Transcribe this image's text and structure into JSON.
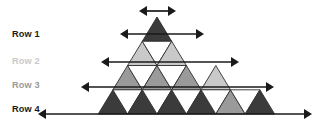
{
  "figure": {
    "background_color": "#ffffff",
    "width": 331,
    "height": 126
  },
  "palette": {
    "dark_gray": "#3b3b3b",
    "medium_gray": "#9a9a9a",
    "light_gray": "#c9c9c9",
    "white": "#ffffff",
    "edge_stroke": "#2f2f2f",
    "arrow_color": "#1a1a1a",
    "label_dark": "#1a1a1a",
    "label_light": "#c9c9c9",
    "label_medium": "#9a9a9a"
  },
  "labels": {
    "items": [
      {
        "text": "Row 1",
        "color": "#1a1a1a",
        "x": 12,
        "y": 35
      },
      {
        "text": "Row 2",
        "color": "#c9c9c9",
        "x": 12,
        "y": 62
      },
      {
        "text": "Row 3",
        "color": "#9a9a9a",
        "x": 12,
        "y": 86
      },
      {
        "text": "Row 4",
        "color": "#1a1a1a",
        "x": 12,
        "y": 110
      }
    ]
  },
  "arrows": {
    "items": [
      {
        "name": "arrow-row-0",
        "y": 11,
        "x1": 139,
        "x2": 176,
        "label": "row 0 span"
      },
      {
        "name": "arrow-row-1",
        "y": 34,
        "x1": 120,
        "x2": 204,
        "label": "row 1 span"
      },
      {
        "name": "arrow-row-2",
        "y": 62,
        "x1": 101,
        "x2": 239,
        "label": "row 2 span"
      },
      {
        "name": "arrow-row-3",
        "y": 87,
        "x1": 81,
        "x2": 274,
        "label": "row 3 span"
      },
      {
        "name": "arrow-row-4",
        "y": 114,
        "x1": 38,
        "x2": 312,
        "label": "row 4 span"
      }
    ],
    "head_length": 8,
    "head_half_width": 5
  },
  "chart_data": {
    "type": "diagram",
    "rows": [
      {
        "row": 1,
        "label": "Row 1",
        "up_triangles": 1,
        "down_triangles": 0,
        "fill": "#3b3b3b"
      },
      {
        "row": 2,
        "label": "Row 2",
        "up_triangles": 2,
        "down_triangles": 1,
        "fill": "#c9c9c9"
      },
      {
        "row": 3,
        "label": "Row 3",
        "up_triangles": 3,
        "down_triangles": 2,
        "fill": "#9a9a9a"
      },
      {
        "row": 4,
        "label": "Row 4",
        "up_triangles": 4,
        "down_triangles": 3,
        "fill": "#3b3b3b"
      }
    ],
    "geometry": {
      "apex": {
        "x": 157,
        "y": 17
      },
      "base_left": {
        "x": 60,
        "y": 114
      },
      "base_right": {
        "x": 295,
        "y": 114
      },
      "cell_width": 29.4,
      "row_height": 24.25
    }
  },
  "triangles": [
    {
      "name": "tri-r1-up-1",
      "row": 1,
      "dir": "up",
      "points": "157.0,17.0 142.3,41.3 171.7,41.3",
      "fill": "#3b3b3b"
    },
    {
      "name": "tri-r2-up-1",
      "row": 2,
      "dir": "up",
      "points": "142.3,41.3 127.6,65.5 157.0,65.5",
      "fill": "#c9c9c9"
    },
    {
      "name": "tri-r2-down-1",
      "row": 2,
      "dir": "down",
      "points": "142.3,41.3 171.7,41.3 157.0,65.5",
      "fill": "#ffffff"
    },
    {
      "name": "tri-r2-up-2",
      "row": 2,
      "dir": "up",
      "points": "171.7,41.3 157.0,65.5 186.4,65.5",
      "fill": "#c9c9c9"
    },
    {
      "name": "tri-r3-up-1",
      "row": 3,
      "dir": "up",
      "points": "127.6,65.5 112.9,89.8 142.3,89.8",
      "fill": "#9a9a9a"
    },
    {
      "name": "tri-r3-down-1",
      "row": 3,
      "dir": "down",
      "points": "127.6,65.5 157.0,65.5 142.3,89.8",
      "fill": "#ffffff"
    },
    {
      "name": "tri-r3-up-2",
      "row": 3,
      "dir": "up",
      "points": "157.0,65.5 142.3,89.8 171.7,89.8",
      "fill": "#9a9a9a"
    },
    {
      "name": "tri-r3-down-2",
      "row": 3,
      "dir": "down",
      "points": "157.0,65.5 186.4,65.5 171.7,89.8",
      "fill": "#ffffff"
    },
    {
      "name": "tri-r3-up-3",
      "row": 3,
      "dir": "up",
      "points": "186.4,65.5 171.7,89.8 201.1,89.8",
      "fill": "#9a9a9a"
    },
    {
      "name": "tri-r4-up-1",
      "row": 4,
      "dir": "up",
      "points": "112.9,89.8 98.2,114.0 127.6,114.0",
      "fill": "#3b3b3b"
    },
    {
      "name": "tri-r4-down-1",
      "row": 4,
      "dir": "down",
      "points": "112.9,89.8 142.3,89.8 127.6,114.0",
      "fill": "#ffffff"
    },
    {
      "name": "tri-r4-up-2",
      "row": 4,
      "dir": "up",
      "points": "142.3,89.8 127.6,114.0 157.0,114.0",
      "fill": "#3b3b3b"
    },
    {
      "name": "tri-r4-down-2",
      "row": 4,
      "dir": "down",
      "points": "142.3,89.8 171.7,89.8 157.0,114.0",
      "fill": "#ffffff"
    },
    {
      "name": "tri-r4-up-3",
      "row": 4,
      "dir": "up",
      "points": "171.7,89.8 157.0,114.0 186.4,114.0",
      "fill": "#3b3b3b"
    },
    {
      "name": "tri-r4-down-3",
      "row": 4,
      "dir": "down",
      "points": "171.7,89.8 201.1,89.8 186.4,114.0",
      "fill": "#ffffff"
    },
    {
      "name": "tri-r4-up-4",
      "row": 4,
      "dir": "up",
      "points": "201.1,89.8 186.4,114.0 215.8,114.0",
      "fill": "#3b3b3b"
    }
  ],
  "right_wing": {
    "note": "Right-hand extension of the figure continuing the tiling toward the base-right vertex",
    "triangles": [
      {
        "name": "tri-r3-up-4",
        "row": 3,
        "dir": "up",
        "points": "215.8,65.5 201.1,89.8 230.5,89.8",
        "fill": "#c9c9c9"
      },
      {
        "name": "tri-r4-down-4",
        "row": 4,
        "dir": "down",
        "points": "201.1,89.8 230.5,89.8 215.8,114.0",
        "fill": "#ffffff"
      },
      {
        "name": "tri-r4-up-5",
        "row": 4,
        "dir": "up",
        "points": "230.5,89.8 215.8,114.0 245.2,114.0",
        "fill": "#9a9a9a"
      },
      {
        "name": "tri-r4-down-5",
        "row": 4,
        "dir": "down",
        "points": "230.5,89.8 259.9,89.8 245.2,114.0",
        "fill": "#ffffff"
      },
      {
        "name": "tri-r4-up-6",
        "row": 4,
        "dir": "up",
        "points": "259.9,89.8 245.2,114.0 274.6,114.0",
        "fill": "#3b3b3b"
      }
    ]
  }
}
